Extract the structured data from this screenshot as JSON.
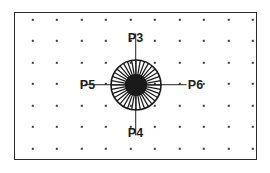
{
  "diagram": {
    "frame": {
      "name": "drawing-frame",
      "x": 14,
      "y": 12,
      "width": 243,
      "height": 148,
      "stroke_color": "#2b2b2b",
      "fill_color": "#ffffff",
      "stroke_width": 1.5
    },
    "grid": {
      "name": "dot-grid",
      "columns": 10,
      "rows": 7,
      "first_dot_x": 33,
      "first_dot_y": 20,
      "spacing_x": 24.5,
      "spacing_y": 21.5,
      "dot_size": 2.4,
      "dot_color": "#3a3a3a"
    },
    "hub": {
      "name": "radial-hub-symbol",
      "center_x": 136,
      "center_y": 85,
      "outer_radius": 25,
      "inner_radius": 11,
      "spoke_count": 36,
      "core_color": "#1a1a1a",
      "spoke_color": "#1a1a1a",
      "ring_color": "#1a1a1a"
    },
    "axes": [
      {
        "name": "axis-arm-up",
        "orientation": "vertical",
        "length": 26
      },
      {
        "name": "axis-arm-down",
        "orientation": "vertical",
        "length": 26
      },
      {
        "name": "axis-arm-left",
        "orientation": "horizontal",
        "length": 26
      },
      {
        "name": "axis-arm-right",
        "orientation": "horizontal",
        "length": 26
      }
    ],
    "points": [
      {
        "id": "P3",
        "label": "P3",
        "position": "top",
        "x": 136,
        "y": 38
      },
      {
        "id": "P4",
        "label": "P4",
        "position": "bottom",
        "x": 136,
        "y": 133
      },
      {
        "id": "P5",
        "label": "P5",
        "position": "left",
        "x": 88,
        "y": 85
      },
      {
        "id": "P6",
        "label": "P6",
        "position": "right",
        "x": 196,
        "y": 85
      }
    ],
    "colors": {
      "ink": "#1d1d1d",
      "frame": "#2b2b2b",
      "grid": "#3a3a3a",
      "background": "#ffffff"
    }
  }
}
